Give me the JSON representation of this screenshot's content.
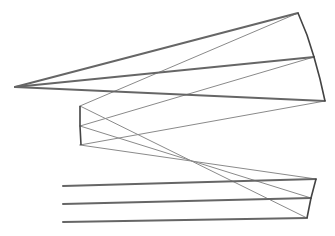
{
  "diagram": {
    "type": "optical-ray-trace",
    "colors": {
      "background": "#ffffff",
      "thick_ray": "#666666",
      "thin_ray": "#8a8a8a",
      "mirror": "#444444"
    },
    "focal_point": [
      15,
      87
    ],
    "input_rays": [
      {
        "start": [
          63,
          186
        ],
        "m3": [
          316,
          179
        ]
      },
      {
        "start": [
          63,
          204
        ],
        "m3": [
          311,
          198
        ]
      },
      {
        "start": [
          63,
          222
        ],
        "m3": [
          307,
          218
        ]
      }
    ],
    "mirror3": {
      "points": [
        [
          316,
          179
        ],
        [
          311,
          198
        ],
        [
          307,
          218
        ]
      ]
    },
    "mirror2": {
      "points": [
        [
          80,
          106
        ],
        [
          80,
          126
        ],
        [
          81,
          145
        ]
      ]
    },
    "mirror1": {
      "points": [
        [
          298,
          13
        ],
        [
          307,
          35
        ],
        [
          314,
          57
        ],
        [
          320,
          79
        ],
        [
          325,
          101
        ]
      ]
    },
    "thin_rays": [
      {
        "from": [
          316,
          179
        ],
        "to": [
          80,
          145
        ]
      },
      {
        "from": [
          311,
          198
        ],
        "to": [
          80,
          126
        ]
      },
      {
        "from": [
          307,
          218
        ],
        "to": [
          80,
          106
        ]
      },
      {
        "from": [
          80,
          145
        ],
        "to": [
          325,
          101
        ]
      },
      {
        "from": [
          80,
          126
        ],
        "to": [
          314,
          57
        ]
      },
      {
        "from": [
          80,
          106
        ],
        "to": [
          298,
          13
        ]
      }
    ],
    "focus_rays": [
      {
        "from": [
          298,
          13
        ],
        "to": [
          15,
          87
        ]
      },
      {
        "from": [
          314,
          57
        ],
        "to": [
          15,
          87
        ]
      },
      {
        "from": [
          325,
          101
        ],
        "to": [
          15,
          87
        ]
      }
    ]
  }
}
